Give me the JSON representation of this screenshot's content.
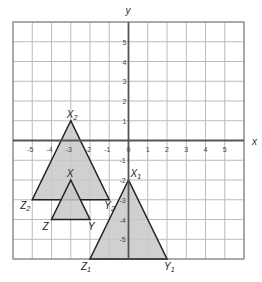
{
  "diagram": {
    "type": "coordinate-grid",
    "axes": {
      "x_label": "x",
      "y_label": "y",
      "x_ticks": [
        "-5",
        "-4",
        "-3",
        "-2",
        "-1",
        "0",
        "1",
        "2",
        "3",
        "4",
        "5"
      ],
      "y_ticks": [
        "5",
        "4",
        "3",
        "2",
        "1",
        "-1",
        "-2",
        "-3",
        "-4",
        "-5"
      ],
      "xlim": [
        -6,
        6
      ],
      "ylim": [
        -6,
        6
      ]
    },
    "triangles": [
      {
        "name": "X2Y2Z2",
        "vertices": [
          {
            "label": "X",
            "sub": "2",
            "x": -3,
            "y": 1
          },
          {
            "label": "Z",
            "sub": "2",
            "x": -5,
            "y": -3
          },
          {
            "label": "Y",
            "sub": "2",
            "x": -1,
            "y": -3
          }
        ]
      },
      {
        "name": "XYZ",
        "vertices": [
          {
            "label": "X",
            "sub": "",
            "x": -3,
            "y": -2
          },
          {
            "label": "Z",
            "sub": "",
            "x": -4,
            "y": -4
          },
          {
            "label": "Y",
            "sub": "",
            "x": -2,
            "y": -4
          }
        ]
      },
      {
        "name": "X1Y1Z1",
        "vertices": [
          {
            "label": "X",
            "sub": "1",
            "x": 0,
            "y": -2
          },
          {
            "label": "Z",
            "sub": "1",
            "x": -2,
            "y": -6
          },
          {
            "label": "Y",
            "sub": "1",
            "x": 2,
            "y": -6
          }
        ]
      }
    ],
    "colors": {
      "fill": "#c8c8c8",
      "stroke": "#222222",
      "grid": "#bbbbbb",
      "axis": "#555555"
    }
  }
}
